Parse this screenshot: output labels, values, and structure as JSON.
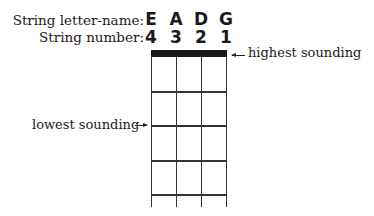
{
  "labels": {
    "letter_row": "String letter-name:",
    "number_row": "String number:",
    "highest": "highest sounding",
    "lowest": "lowest sounding"
  },
  "strings": [
    {
      "letter": "E",
      "number": "4"
    },
    {
      "letter": "A",
      "number": "3"
    },
    {
      "letter": "D",
      "number": "2"
    },
    {
      "letter": "G",
      "number": "1"
    }
  ],
  "colors": {
    "ink": "#1a1a1a",
    "background": "#ffffff"
  }
}
